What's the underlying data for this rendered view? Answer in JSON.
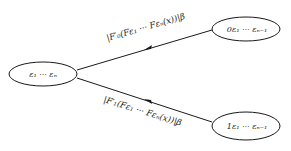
{
  "diagram": {
    "nodes": [
      {
        "id": "root",
        "label": "ε₁ ··· εₙ",
        "cx": 43,
        "cy": 74,
        "rx": 34,
        "ry": 12
      },
      {
        "id": "child0",
        "label": "0ε₁ ··· εₙ₋₁",
        "cx": 246,
        "cy": 29,
        "rx": 34,
        "ry": 12
      },
      {
        "id": "child1",
        "label": "1ε₁ ··· εₙ₋₁",
        "cx": 246,
        "cy": 126,
        "rx": 34,
        "ry": 14
      }
    ],
    "edges": [
      {
        "from": "child0",
        "to": "root",
        "label": "|F′₀(F_{ε₁} ··· F_{εₙ}(x))|^β",
        "display": "|F′₀(Fε₁ ··· Fεₙ(x))|β"
      },
      {
        "from": "child1",
        "to": "root",
        "label": "|F′₁(F_{ε₁} ··· F_{εₙ}(x))|^β",
        "display": "|F′₁(Fε₁ ··· Fεₙ(x))|β"
      }
    ],
    "colors": {
      "stroke": "#1a1a1a",
      "background": "#ffffff"
    }
  }
}
